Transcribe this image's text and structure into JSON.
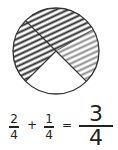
{
  "diagram": {
    "type": "fraction-circle",
    "parts_total": 4,
    "regions": [
      {
        "name": "top-quarter",
        "fill": "dark-hatch",
        "color": "#333333"
      },
      {
        "name": "left-quarter",
        "fill": "dark-hatch",
        "color": "#333333"
      },
      {
        "name": "right-quarter",
        "fill": "gray-hatch",
        "color": "#888888"
      },
      {
        "name": "bottom-quarter",
        "fill": "none",
        "color": "#ffffff"
      }
    ]
  },
  "equation": {
    "term1": {
      "numerator": "2",
      "denominator": "4"
    },
    "plus": "+",
    "term2": {
      "numerator": "1",
      "denominator": "4"
    },
    "equals": "=",
    "result": {
      "numerator": "3",
      "denominator": "4"
    }
  }
}
